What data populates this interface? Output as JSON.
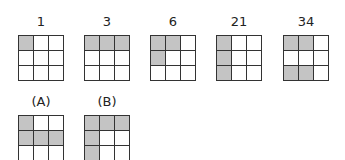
{
  "colors": {
    "shaded": "#c4c4c4",
    "empty": "#ffffff",
    "line": "#333333"
  },
  "top_row": [
    {
      "label": "1",
      "cells": [
        1,
        0,
        0,
        0,
        0,
        0,
        0,
        0,
        0
      ]
    },
    {
      "label": "3",
      "cells": [
        1,
        1,
        1,
        0,
        0,
        0,
        0,
        0,
        0
      ]
    },
    {
      "label": "6",
      "cells": [
        1,
        1,
        0,
        1,
        0,
        0,
        0,
        0,
        0
      ]
    },
    {
      "label": "21",
      "cells": [
        1,
        0,
        0,
        1,
        0,
        0,
        1,
        0,
        0
      ]
    },
    {
      "label": "34",
      "cells": [
        1,
        1,
        0,
        0,
        0,
        0,
        1,
        1,
        0
      ]
    }
  ],
  "bottom_row": [
    {
      "label": "(A)",
      "cells": [
        1,
        0,
        0,
        1,
        1,
        1,
        0,
        0,
        0
      ]
    },
    {
      "label": "(B)",
      "cells": [
        1,
        1,
        1,
        1,
        0,
        0,
        1,
        0,
        0
      ]
    }
  ]
}
